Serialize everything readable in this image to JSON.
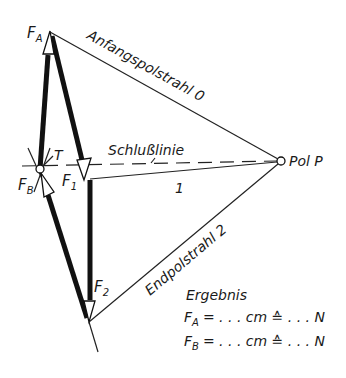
{
  "diagram": {
    "type": "force polygon (Krafteck) with pole rays",
    "labels": {
      "fa": {
        "base": "F",
        "sub": "A"
      },
      "fb": {
        "base": "F",
        "sub": "B"
      },
      "f1": {
        "base": "F",
        "sub": "1"
      },
      "f2": {
        "base": "F",
        "sub": "2"
      },
      "t": "T",
      "schlusslinie": "Schlußlinie",
      "pol": "Pol P",
      "ray0": "Anfangspolstrahl 0",
      "ray1": "1",
      "ray2": "Endpolstrahl 2"
    },
    "result": {
      "title": "Ergebnis",
      "rows": [
        {
          "base": "F",
          "sub": "A",
          "text": "= . . . cm ≙ . . . N"
        },
        {
          "base": "F",
          "sub": "B",
          "text": "= . . . cm ≙ . . . N"
        }
      ]
    },
    "points": {
      "FA_top": [
        50,
        32
      ],
      "T": [
        40,
        169
      ],
      "F1_tip": [
        84,
        164
      ],
      "F2_bottom": [
        89,
        322
      ],
      "Pol_P": [
        281,
        161
      ]
    }
  }
}
